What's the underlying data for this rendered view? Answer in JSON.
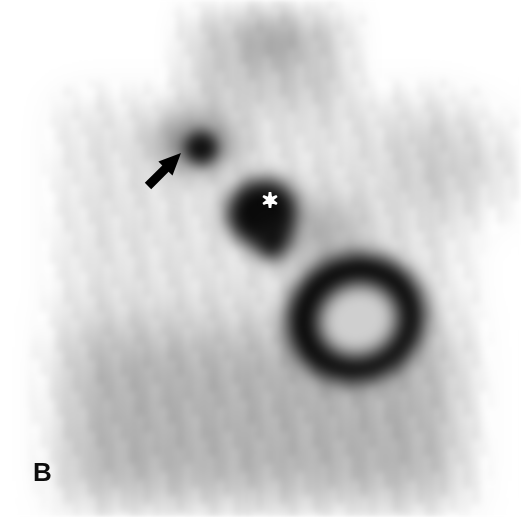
{
  "figure": {
    "panel_label": "B",
    "panel_label_position": {
      "x": 33,
      "y": 459
    },
    "modality": "planar scintigraphy",
    "orientation": "anterior",
    "width": 521,
    "height": 517,
    "background_color": "#ffffff"
  },
  "annotations": [
    {
      "name": "arrow-annotation",
      "symbol": "arrow",
      "color": "#000000",
      "points_to": "focal-uptake-upper-left",
      "tail": {
        "x": 148,
        "y": 186
      },
      "tip": {
        "x": 181,
        "y": 153
      },
      "shaft_width": 9,
      "head_length": 22,
      "head_width": 20
    },
    {
      "name": "asterisk-annotation",
      "symbol": "*",
      "color": "#ffffff",
      "marks": "central-mediastinal-uptake",
      "center": {
        "x": 270,
        "y": 200
      },
      "size": 16,
      "points": 6
    }
  ],
  "image_regions": [
    {
      "name": "neck-column",
      "label": "central neck / upper mediastinum column",
      "shape": "rect",
      "x": 188,
      "y": 14,
      "w": 160,
      "h": 100,
      "gray": "#c8c8c8",
      "blur": 16
    },
    {
      "name": "neck-focal-uptake",
      "label": "superior neck focal activity",
      "shape": "ellipse",
      "cx": 272,
      "cy": 42,
      "rx": 32,
      "ry": 24,
      "gray": "#8e8e8e",
      "blur": 16
    },
    {
      "name": "torso-body",
      "label": "thorax soft-tissue background",
      "shape": "rect",
      "x": 62,
      "y": 100,
      "w": 400,
      "h": 398,
      "gray": "#e2e2e2",
      "blur": 20
    },
    {
      "name": "lower-thorax",
      "label": "lower thorax / upper abdomen",
      "shape": "rect",
      "x": 72,
      "y": 330,
      "w": 380,
      "h": 168,
      "gray": "#a9a9a9",
      "blur": 26
    },
    {
      "name": "right-shoulder-mass",
      "label": "right shoulder soft activity",
      "shape": "ellipse",
      "cx": 452,
      "cy": 166,
      "rx": 62,
      "ry": 48,
      "gray": "#b4b4b4",
      "blur": 24
    },
    {
      "name": "focal-uptake-upper-left",
      "label": "focal hot spot indicated by arrow",
      "shape": "ellipse",
      "cx": 201,
      "cy": 148,
      "rx": 17,
      "ry": 16,
      "gray": "#0f0f0f",
      "blur": 7
    },
    {
      "name": "focal-uptake-halo",
      "label": "halo around arrow focus",
      "shape": "ellipse",
      "cx": 196,
      "cy": 143,
      "rx": 42,
      "ry": 27,
      "gray": "#656565",
      "blur": 16
    },
    {
      "name": "central-mediastinal-uptake",
      "label": "central intense uptake marked by asterisk",
      "shape": "blob",
      "cx": 262,
      "cy": 212,
      "rx": 36,
      "ry": 33,
      "gray": "#0a0a0a",
      "blur": 9
    },
    {
      "name": "central-uptake-tail",
      "label": "inferior extension of central uptake",
      "shape": "ellipse",
      "cx": 272,
      "cy": 238,
      "rx": 17,
      "ry": 22,
      "gray": "#101010",
      "blur": 9
    },
    {
      "name": "paracentral-band",
      "label": "diagonal band toward ring",
      "shape": "ellipse",
      "cx": 318,
      "cy": 232,
      "rx": 48,
      "ry": 26,
      "gray": "#777777",
      "blur": 20
    },
    {
      "name": "ring-lesion",
      "label": "ring-shaped photopenic-centre lesion",
      "shape": "ring",
      "cx": 356,
      "cy": 318,
      "outer_rx": 70,
      "outer_ry": 64,
      "inner_rx": 40,
      "inner_ry": 36,
      "rotation": -18,
      "gray": "#050505",
      "center_gray": "#cfcfcf",
      "blur": 9
    }
  ],
  "colors": {
    "background": "#ffffff",
    "body_light": "#e2e2e2",
    "body_mid": "#a9a9a9",
    "uptake_dark": "#0a0a0a",
    "annotation_black": "#000000",
    "annotation_white": "#ffffff"
  }
}
